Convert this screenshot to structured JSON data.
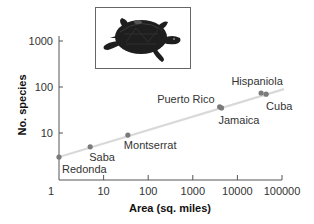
{
  "chart_data": {
    "type": "scatter",
    "title": "",
    "xlabel": "Area (sq. miles)",
    "ylabel": "No. species",
    "xscale": "log",
    "yscale": "log",
    "xlim": [
      1,
      100000
    ],
    "ylim": [
      1,
      1000
    ],
    "x_ticks": [
      "1",
      "10",
      "100",
      "1000",
      "10000",
      "100000"
    ],
    "y_ticks": [
      "10",
      "100",
      "1000"
    ],
    "grid": false,
    "legend": null,
    "points": [
      {
        "label": "Redonda",
        "x": 1,
        "y": 3
      },
      {
        "label": "Saba",
        "x": 5,
        "y": 5
      },
      {
        "label": "Montserrat",
        "x": 35,
        "y": 9
      },
      {
        "label": "Puerto Rico",
        "x": 4000,
        "y": 37
      },
      {
        "label": "Jamaica",
        "x": 4400,
        "y": 35
      },
      {
        "label": "Hispaniola",
        "x": 34000,
        "y": 74
      },
      {
        "label": "Cuba",
        "x": 44000,
        "y": 70
      }
    ],
    "trendline": {
      "type": "power-law fit",
      "x_start": 1,
      "y_start": 3,
      "x_end": 100000,
      "y_end": 90
    },
    "annotations": [
      "turtle illustration inset above plot"
    ],
    "colors": {
      "points": "#7a7a7a",
      "trendline": "#d9d9d9",
      "axis": "#555555"
    }
  },
  "labels": {
    "xlabel": "Area (sq. miles)",
    "ylabel": "No. species",
    "x_ticks": [
      "1",
      "10",
      "100",
      "1000",
      "10000",
      "100000"
    ],
    "y_ticks": [
      "10",
      "100",
      "1000"
    ],
    "points": [
      "Redonda",
      "Saba",
      "Montserrat",
      "Puerto Rico",
      "Jamaica",
      "Hispaniola",
      "Cuba"
    ]
  },
  "inset": {
    "subject": "turtle-illustration"
  }
}
